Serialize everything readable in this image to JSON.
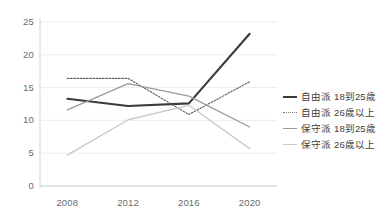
{
  "chart_data": {
    "type": "line",
    "title": "",
    "xlabel": "",
    "ylabel": "",
    "categories": [
      "2008",
      "2012",
      "2016",
      "2020"
    ],
    "x": [
      2008,
      2012,
      2016,
      2020
    ],
    "xlim": [
      2006.2,
      2021.8
    ],
    "ylim": [
      0,
      25
    ],
    "yticks": [
      0,
      5,
      10,
      15,
      20,
      25
    ],
    "ytick_labels": [
      "0",
      "5",
      "10",
      "15",
      "20",
      "25"
    ],
    "grid": "horizontal",
    "legend_position": "right",
    "series": [
      {
        "name": "自由派 18到25歲",
        "values": [
          13.3,
          12.2,
          12.6,
          23.2
        ],
        "color": "#3a3a3a",
        "style": "solid",
        "width": 2.1
      },
      {
        "name": "自由派 26歲以上",
        "values": [
          16.4,
          16.4,
          10.9,
          15.9
        ],
        "color": "#5a5a5a",
        "style": "dotted",
        "width": 1.1
      },
      {
        "name": "保守派 18到25歲",
        "values": [
          11.6,
          15.6,
          13.7,
          9.0
        ],
        "color": "#9a9a9a",
        "style": "solid",
        "width": 1.3
      },
      {
        "name": "保守派 26歲以上",
        "values": [
          4.7,
          10.1,
          12.3,
          5.7
        ],
        "color": "#c9c9c9",
        "style": "solid",
        "width": 1.3
      }
    ],
    "legend": [
      {
        "label": "自由派 18到25歲",
        "color": "#3a3a3a",
        "style": "solid",
        "width": 2.1
      },
      {
        "label": "自由派 26歲以上",
        "color": "#7a7a7a",
        "style": "dotted",
        "width": 1.1
      },
      {
        "label": "保守派 18到25歲",
        "color": "#9a9a9a",
        "style": "solid",
        "width": 1.3
      },
      {
        "label": "保守派 26歲以上",
        "color": "#c9c9c9",
        "style": "solid",
        "width": 1.3
      }
    ],
    "colors": {
      "background": "#ffffff",
      "grid": "#ededed",
      "axis": "#d2d2d2",
      "tick_text": "#6b6b6b",
      "legend_text": "#3d3d3d"
    }
  }
}
